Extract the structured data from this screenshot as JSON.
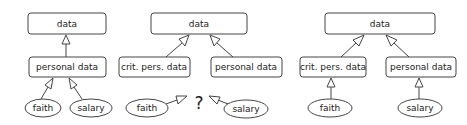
{
  "diagrams": [
    {
      "name": "left",
      "nodes": {
        "data": "data",
        "personal": "personal data",
        "faith": "faith",
        "salary": "salary"
      }
    },
    {
      "name": "middle",
      "nodes": {
        "data": "data",
        "crit": "crit. pers. data",
        "personal": "personal data",
        "faith": "faith",
        "salary": "salary",
        "unknown": "?"
      }
    },
    {
      "name": "right",
      "nodes": {
        "data": "data",
        "crit": "crit. pers. data",
        "personal": "personal data",
        "faith": "faith",
        "salary": "salary"
      }
    }
  ],
  "edge_style": "hollow-triangle generalization arrows",
  "colors": {
    "stroke": "#444444",
    "text": "#222222",
    "background": "#ffffff"
  }
}
